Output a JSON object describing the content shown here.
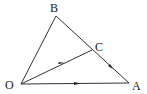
{
  "diagram": {
    "labels": {
      "O": "O",
      "A": "A",
      "B": "B",
      "C": "C"
    },
    "colors": {
      "stroke": "#333333",
      "text": "#222222",
      "background": "#ffffff"
    },
    "points": {
      "O": [
        21,
        84
      ],
      "A": [
        129,
        83
      ],
      "B": [
        56,
        16
      ],
      "C": [
        92,
        50
      ]
    },
    "segments": [
      "OA",
      "OB",
      "BA",
      "OC"
    ],
    "arrows": [
      "O→C",
      "C→A",
      "O→A"
    ]
  }
}
